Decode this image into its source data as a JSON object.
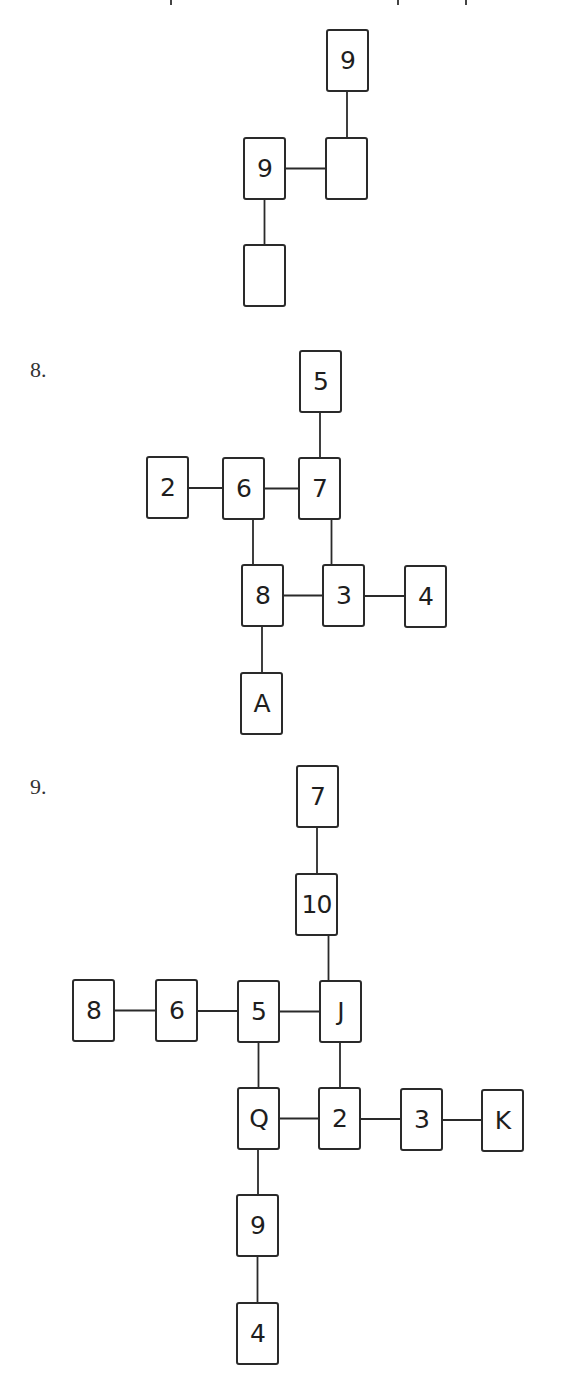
{
  "page": {
    "background": "#ffffff",
    "card_border_color": "#2a2a2a",
    "line_color": "#2a2a2a"
  },
  "top_cutoff_text": {
    "descender_marks_x": [
      170,
      397,
      465
    ]
  },
  "diagrams": [
    {
      "label": "",
      "cards": [
        {
          "id": "a",
          "value": "9",
          "x": 326,
          "y": 29
        },
        {
          "id": "b",
          "value": "9",
          "x": 243,
          "y": 137
        },
        {
          "id": "c",
          "value": "",
          "x": 325,
          "y": 137
        },
        {
          "id": "d",
          "value": "",
          "x": 243,
          "y": 244
        }
      ],
      "edges": [
        [
          "a",
          "c"
        ],
        [
          "b",
          "c"
        ],
        [
          "b",
          "d"
        ]
      ]
    },
    {
      "label": "8.",
      "label_pos": {
        "x": 30,
        "y": 357
      },
      "cards": [
        {
          "id": "c5",
          "value": "5",
          "x": 299,
          "y": 350
        },
        {
          "id": "c2",
          "value": "2",
          "x": 146,
          "y": 456
        },
        {
          "id": "c6",
          "value": "6",
          "x": 222,
          "y": 457
        },
        {
          "id": "c7",
          "value": "7",
          "x": 298,
          "y": 457
        },
        {
          "id": "c8",
          "value": "8",
          "x": 241,
          "y": 564
        },
        {
          "id": "c3",
          "value": "3",
          "x": 322,
          "y": 564
        },
        {
          "id": "c4",
          "value": "4",
          "x": 404,
          "y": 565
        },
        {
          "id": "cA",
          "value": "A",
          "x": 240,
          "y": 672
        }
      ],
      "edges": [
        [
          "c5",
          "c7"
        ],
        [
          "c2",
          "c6"
        ],
        [
          "c6",
          "c7"
        ],
        [
          "c6",
          "c8"
        ],
        [
          "c7",
          "c3"
        ],
        [
          "c8",
          "c3"
        ],
        [
          "c3",
          "c4"
        ],
        [
          "c8",
          "cA"
        ]
      ]
    },
    {
      "label": "9.",
      "label_pos": {
        "x": 30,
        "y": 774
      },
      "cards": [
        {
          "id": "d7",
          "value": "7",
          "x": 296,
          "y": 765
        },
        {
          "id": "d10",
          "value": "10",
          "x": 295,
          "y": 873
        },
        {
          "id": "d8",
          "value": "8",
          "x": 72,
          "y": 979
        },
        {
          "id": "d6",
          "value": "6",
          "x": 155,
          "y": 979
        },
        {
          "id": "d5",
          "value": "5",
          "x": 237,
          "y": 980
        },
        {
          "id": "dJ",
          "value": "J",
          "x": 319,
          "y": 980
        },
        {
          "id": "dQ",
          "value": "Q",
          "x": 237,
          "y": 1087
        },
        {
          "id": "d2",
          "value": "2",
          "x": 318,
          "y": 1087
        },
        {
          "id": "d3",
          "value": "3",
          "x": 400,
          "y": 1088
        },
        {
          "id": "dK",
          "value": "K",
          "x": 481,
          "y": 1089
        },
        {
          "id": "d9",
          "value": "9",
          "x": 236,
          "y": 1194
        },
        {
          "id": "d4",
          "value": "4",
          "x": 236,
          "y": 1302
        }
      ],
      "edges": [
        [
          "d7",
          "d10"
        ],
        [
          "d10",
          "dJ"
        ],
        [
          "d8",
          "d6"
        ],
        [
          "d6",
          "d5"
        ],
        [
          "d5",
          "dJ"
        ],
        [
          "d5",
          "dQ"
        ],
        [
          "dJ",
          "d2"
        ],
        [
          "dQ",
          "d2"
        ],
        [
          "d2",
          "d3"
        ],
        [
          "d3",
          "dK"
        ],
        [
          "dQ",
          "d9"
        ],
        [
          "d9",
          "d4"
        ]
      ]
    }
  ]
}
